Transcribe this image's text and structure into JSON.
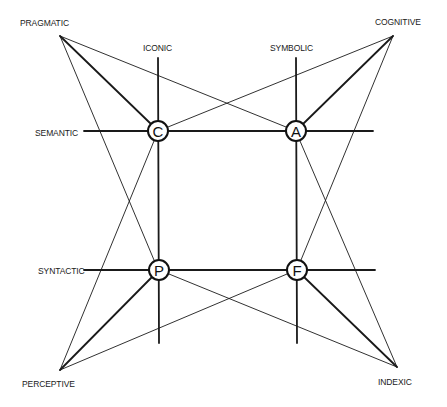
{
  "diagram": {
    "type": "semiotic-square-diagram",
    "colors": {
      "line": "#1a1a1a",
      "background": "#ffffff"
    },
    "nodes": [
      {
        "id": "C",
        "letter": "C",
        "x": 158,
        "y": 131
      },
      {
        "id": "A",
        "letter": "A",
        "x": 296,
        "y": 131
      },
      {
        "id": "P",
        "letter": "P",
        "x": 159,
        "y": 270
      },
      {
        "id": "F",
        "letter": "F",
        "x": 297,
        "y": 270
      }
    ],
    "corners": [
      {
        "id": "pragmatic",
        "label": "PRAGMATIC",
        "x": 60,
        "y": 36
      },
      {
        "id": "cognitive",
        "label": "COGNITIVE",
        "x": 393,
        "y": 36
      },
      {
        "id": "perceptive",
        "label": "PERCEPTIVE",
        "x": 60,
        "y": 370
      },
      {
        "id": "indexic",
        "label": "INDEXIC",
        "x": 397,
        "y": 367
      }
    ],
    "axes": [
      {
        "id": "iconic",
        "label": "ICONIC"
      },
      {
        "id": "symbolic",
        "label": "SYMBOLIC"
      },
      {
        "id": "semantic",
        "label": "SEMANTIC"
      },
      {
        "id": "syntactic",
        "label": "SYNTACTIC"
      }
    ],
    "connections": [
      {
        "from": "pragmatic",
        "to": "C",
        "weight": "thick"
      },
      {
        "from": "pragmatic",
        "to": "A",
        "weight": "thin"
      },
      {
        "from": "pragmatic",
        "to": "P",
        "weight": "thin"
      },
      {
        "from": "cognitive",
        "to": "A",
        "weight": "thick"
      },
      {
        "from": "cognitive",
        "to": "C",
        "weight": "thin"
      },
      {
        "from": "cognitive",
        "to": "F",
        "weight": "thin"
      },
      {
        "from": "perceptive",
        "to": "P",
        "weight": "thick"
      },
      {
        "from": "perceptive",
        "to": "C",
        "weight": "thin"
      },
      {
        "from": "perceptive",
        "to": "F",
        "weight": "thin"
      },
      {
        "from": "indexic",
        "to": "F",
        "weight": "thick"
      },
      {
        "from": "indexic",
        "to": "P",
        "weight": "thin"
      },
      {
        "from": "indexic",
        "to": "A",
        "weight": "thin"
      }
    ]
  }
}
